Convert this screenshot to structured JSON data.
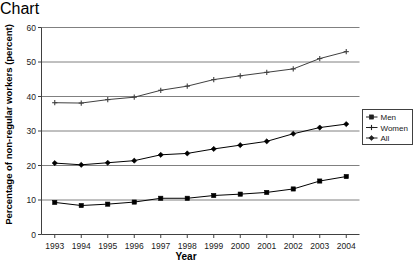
{
  "chart_data": {
    "type": "line",
    "title": "",
    "xlabel": "Year",
    "ylabel": "Percentage of non-regular workers (percent)",
    "x": [
      1993,
      1994,
      1995,
      1996,
      1997,
      1998,
      1999,
      2000,
      2001,
      2002,
      2003,
      2004
    ],
    "categories": [
      "1993",
      "1994",
      "1995",
      "1996",
      "1997",
      "1998",
      "1999",
      "2000",
      "2001",
      "2002",
      "2003",
      "2004"
    ],
    "xlim": [
      1992.5,
      2004.5
    ],
    "ylim": [
      0,
      60
    ],
    "yticks": [
      0,
      10,
      20,
      30,
      40,
      50,
      60
    ],
    "ytick_labels": [
      "0",
      "10",
      "20",
      "30",
      "40",
      "50",
      "60"
    ],
    "grid": "horizontal",
    "legend_position": "right",
    "series": [
      {
        "name": "Men",
        "marker": "square",
        "color": "#000000",
        "values": [
          9.3,
          8.4,
          8.8,
          9.4,
          10.5,
          10.5,
          11.3,
          11.7,
          12.2,
          13.2,
          15.5,
          16.8
        ]
      },
      {
        "name": "Women",
        "marker": "cross",
        "color": "#404040",
        "values": [
          38.2,
          38.1,
          39.1,
          39.8,
          41.8,
          43.0,
          44.9,
          46.0,
          47.0,
          48.0,
          51.0,
          53.0
        ]
      },
      {
        "name": "All",
        "marker": "diamond",
        "color": "#000000",
        "values": [
          20.7,
          20.2,
          20.8,
          21.4,
          23.1,
          23.5,
          24.8,
          25.9,
          27.0,
          29.2,
          31.0,
          32.0
        ]
      }
    ]
  },
  "legend": {
    "items": [
      {
        "label": "Men",
        "marker": "square"
      },
      {
        "label": "Women",
        "marker": "cross"
      },
      {
        "label": "All",
        "marker": "diamond"
      }
    ]
  }
}
